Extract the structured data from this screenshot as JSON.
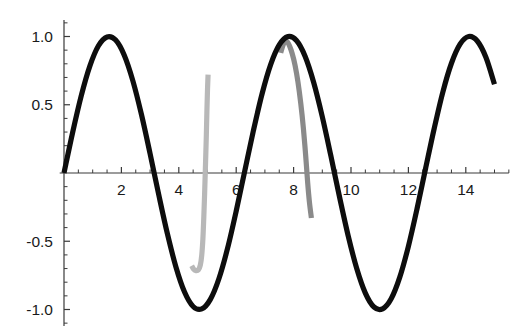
{
  "chart_data": {
    "type": "line",
    "title": "",
    "subtitle": "",
    "xlabel": "",
    "ylabel": "",
    "xlim": [
      -0.15,
      15.5
    ],
    "ylim": [
      -1.12,
      1.12
    ],
    "grid": false,
    "legend": null,
    "axis_style": "mathematica-crossed-axes",
    "origin": {
      "x": 0,
      "y": 0
    },
    "xticks": {
      "major_values": [
        2,
        4,
        6,
        8,
        10,
        12,
        14
      ],
      "major_labels": [
        "2",
        "4",
        "6",
        "8",
        "10",
        "12",
        "14"
      ],
      "minor_step": 0.5
    },
    "yticks": {
      "major_values": [
        1.0,
        0.5,
        -0.5,
        -1.0
      ],
      "major_labels": [
        "1.0",
        "0.5",
        "-0.5",
        "-1.0"
      ],
      "minor_step": 0.1
    },
    "series": [
      {
        "name": "black-sine",
        "color": "#0d0d0d",
        "linewidth": 5.2,
        "description": "sin(x) over full domain",
        "formula": "sin(x)",
        "x_start": 0.0,
        "x_end": 15.0,
        "peaks": [
          {
            "x": 1.57,
            "y": 1.0
          },
          {
            "x": 7.85,
            "y": 1.0
          },
          {
            "x": 14.1,
            "y": 1.0
          }
        ],
        "troughs": [
          {
            "x": 4.71,
            "y": -1.0
          },
          {
            "x": 11.0,
            "y": -1.0
          }
        ],
        "end_point": {
          "x": 15.0,
          "y": 0.65
        },
        "points": [
          [
            0.0,
            0.0
          ],
          [
            0.3,
            0.296
          ],
          [
            0.6,
            0.565
          ],
          [
            0.9,
            0.783
          ],
          [
            1.2,
            0.932
          ],
          [
            1.5,
            0.997
          ],
          [
            1.8,
            0.974
          ],
          [
            2.1,
            0.863
          ],
          [
            2.4,
            0.675
          ],
          [
            2.7,
            0.427
          ],
          [
            3.0,
            0.141
          ],
          [
            3.3,
            -0.158
          ],
          [
            3.6,
            -0.443
          ],
          [
            3.9,
            -0.688
          ],
          [
            4.2,
            -0.872
          ],
          [
            4.5,
            -0.978
          ],
          [
            4.8,
            -0.996
          ],
          [
            5.1,
            -0.926
          ],
          [
            5.4,
            -0.773
          ],
          [
            5.7,
            -0.551
          ],
          [
            6.0,
            -0.279
          ],
          [
            6.3,
            0.017
          ],
          [
            6.6,
            0.311
          ],
          [
            6.9,
            0.579
          ],
          [
            7.2,
            0.794
          ],
          [
            7.5,
            0.938
          ],
          [
            7.8,
            0.999
          ],
          [
            8.1,
            0.97
          ],
          [
            8.4,
            0.855
          ],
          [
            8.7,
            0.663
          ],
          [
            9.0,
            0.412
          ],
          [
            9.3,
            0.124
          ],
          [
            9.6,
            -0.175
          ],
          [
            9.9,
            -0.458
          ],
          [
            10.2,
            -0.7
          ],
          [
            10.5,
            -0.88
          ],
          [
            10.8,
            -0.982
          ],
          [
            11.1,
            -0.995
          ],
          [
            11.4,
            -0.921
          ],
          [
            11.7,
            -0.763
          ],
          [
            12.0,
            -0.537
          ],
          [
            12.3,
            -0.263
          ],
          [
            12.6,
            0.034
          ],
          [
            12.9,
            0.327
          ],
          [
            13.2,
            0.593
          ],
          [
            13.5,
            0.804
          ],
          [
            13.8,
            0.944
          ],
          [
            14.1,
            1.0
          ],
          [
            14.4,
            0.967
          ],
          [
            14.7,
            0.848
          ],
          [
            15.0,
            0.65
          ]
        ]
      },
      {
        "name": "light-gray-branch",
        "color": "#b8b8b8",
        "linewidth": 5.2,
        "description": "short steep branch with minimum near x=4.7, rising sharply to clipped top near x=5.0",
        "min_point": {
          "x": 4.72,
          "y": -0.7
        },
        "top_point": {
          "x": 5.02,
          "y": 0.72
        },
        "left_end": {
          "x": 4.45,
          "y": -0.68
        },
        "points": [
          [
            4.45,
            -0.68
          ],
          [
            4.52,
            -0.705
          ],
          [
            4.6,
            -0.715
          ],
          [
            4.68,
            -0.71
          ],
          [
            4.75,
            -0.675
          ],
          [
            4.8,
            -0.6
          ],
          [
            4.84,
            -0.48
          ],
          [
            4.87,
            -0.33
          ],
          [
            4.9,
            -0.15
          ],
          [
            4.93,
            0.06
          ],
          [
            4.96,
            0.28
          ],
          [
            4.98,
            0.46
          ],
          [
            5.0,
            0.61
          ],
          [
            5.02,
            0.72
          ]
        ]
      },
      {
        "name": "dark-gray-branch",
        "color": "#8a8a8a",
        "linewidth": 5.2,
        "description": "arc peaking just under 1.0 near x=7.75 then falling steeply to about -0.33 at x=8.6",
        "peak_point": {
          "x": 7.72,
          "y": 0.965
        },
        "end_point": {
          "x": 8.62,
          "y": -0.33
        },
        "points": [
          [
            7.55,
            0.88
          ],
          [
            7.62,
            0.93
          ],
          [
            7.7,
            0.963
          ],
          [
            7.78,
            0.96
          ],
          [
            7.86,
            0.93
          ],
          [
            7.95,
            0.875
          ],
          [
            8.05,
            0.79
          ],
          [
            8.15,
            0.67
          ],
          [
            8.25,
            0.51
          ],
          [
            8.34,
            0.33
          ],
          [
            8.42,
            0.13
          ],
          [
            8.49,
            -0.07
          ],
          [
            8.55,
            -0.21
          ],
          [
            8.62,
            -0.33
          ]
        ]
      }
    ]
  },
  "geometry": {
    "origin_px": {
      "x": 64,
      "y": 173
    },
    "x_unit_px": 28.7,
    "y_unit_px": 136.5
  }
}
